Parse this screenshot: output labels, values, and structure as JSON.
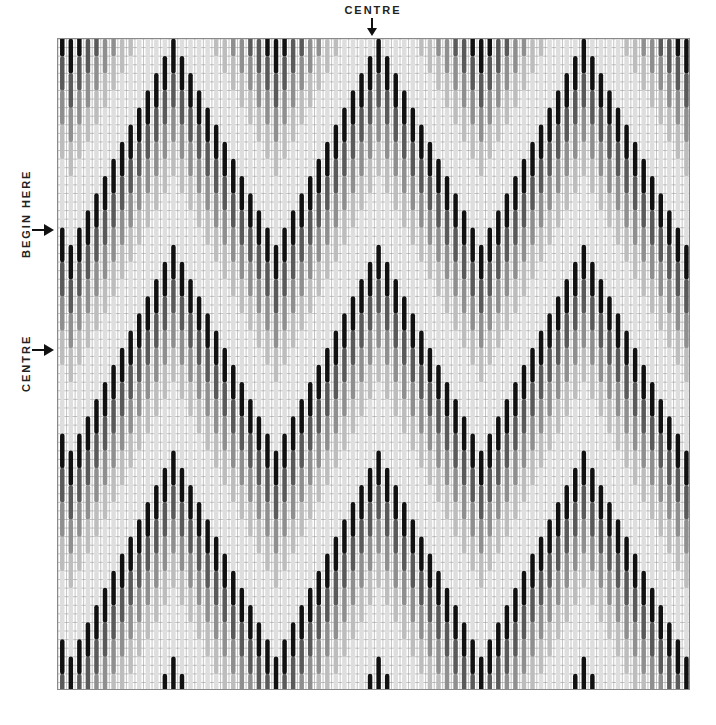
{
  "labels": {
    "top_centre": "CENTRE",
    "begin_here": "BEGIN HERE",
    "left_centre": "CENTRE"
  },
  "grid": {
    "columns": 74,
    "rows": 76,
    "cell_width": 8.55,
    "cell_height": 8.58,
    "line_color": "#9a9a9a"
  },
  "pattern": {
    "type": "bargello flame stitch",
    "stitch_rows": 4,
    "step_rows_per_column": 2,
    "half_period_columns": 12,
    "peak_columns": [
      13,
      37,
      61
    ],
    "shades": [
      "#111111",
      "#5a5a5a",
      "#8f8f8f",
      "#bdbdbd",
      "#dedede",
      "#dedede"
    ],
    "shade_names": [
      "black",
      "dark-grey",
      "mid-grey",
      "light-grey",
      "pale-grey",
      "pale-grey"
    ]
  }
}
